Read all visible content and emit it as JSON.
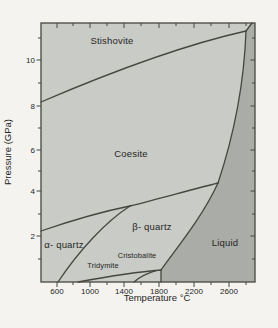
{
  "figure": {
    "description_labels": {
      "stishovite": "Stishovite",
      "coesite": "Coesite",
      "alpha_quartz": "α- quartz",
      "beta_quartz": "β- quartz",
      "cristobalite": "Cristobalite",
      "tridymite": "Tridymite",
      "liquid": "Liquid"
    }
  },
  "axes": {
    "x": {
      "title": "Temperature °C",
      "major": [
        {
          "t": "600",
          "px": 57
        },
        {
          "t": "1000",
          "px": 90
        },
        {
          "t": "1400",
          "px": 124
        },
        {
          "t": "1800",
          "px": 159
        },
        {
          "t": "2200",
          "px": 194
        },
        {
          "t": "2600",
          "px": 229
        }
      ],
      "minor_px": [
        73,
        107,
        141,
        176,
        211,
        246
      ]
    },
    "y": {
      "title": "Pressure (GPa)",
      "major": [
        {
          "t": "2",
          "py": 236
        },
        {
          "t": "4",
          "py": 191
        },
        {
          "t": "6",
          "py": 150
        },
        {
          "t": "8",
          "py": 106
        },
        {
          "t": "10",
          "py": 60
        }
      ],
      "minor_py": [
        259,
        214,
        171,
        128,
        83,
        38
      ]
    }
  },
  "colors": {
    "page_bg": "#f4f3ef",
    "field_light": "#c9cbc6",
    "liquid_dark": "#a9aca7",
    "line": "#45473f",
    "text": "#26261f"
  },
  "paths": {
    "liquid_region": "M161,282 L161,270 C175,250 202,218 218,183 C234,135 244,85 246,31 L252,23 L255,23 L255,282 Z",
    "boundaries": [
      {
        "name": "coesite-stishovite",
        "d": "M41,102 C90,81 170,48 246,31"
      },
      {
        "name": "stishovite-liquid",
        "d": "M246,31 L252,23"
      },
      {
        "name": "coesite-liquid",
        "d": "M218,183 C234,135 244,85 246,31"
      },
      {
        "name": "beta-quartz-coesite",
        "d": "M130,206 C155,200 190,190 218,183"
      },
      {
        "name": "alpha-quartz-coesite",
        "d": "M41,231 C70,221 105,211 130,206"
      },
      {
        "name": "alpha-beta-quartz",
        "d": "M58,282 C78,252 105,222 130,206"
      },
      {
        "name": "beta-quartz-liquid",
        "d": "M161,270 C175,250 202,218 218,183"
      },
      {
        "name": "cristobalite-liquid",
        "d": "M161,282 L161,270"
      },
      {
        "name": "quartz-tridymite",
        "d": "M78,282 C105,277 135,272 161,270"
      },
      {
        "name": "tridymite-cristobalite",
        "d": "M134,282 C141,276 148,273 156,270.7"
      }
    ]
  },
  "chart_data": {
    "type": "line",
    "subtype": "phase-diagram",
    "xlabel": "Temperature °C",
    "ylabel": "Pressure (GPa)",
    "xlim": [
      420,
      2890
    ],
    "ylim": [
      0,
      11.6
    ],
    "x_ticks": [
      600,
      1000,
      1400,
      1800,
      2200,
      2600
    ],
    "y_ticks": [
      2,
      4,
      6,
      8,
      10
    ],
    "grid": false,
    "regions": [
      "Stishovite",
      "Coesite",
      "α- quartz",
      "β- quartz",
      "Cristobalite",
      "Tridymite",
      "Liquid"
    ],
    "series": [
      {
        "name": "coesite–stishovite boundary",
        "x": [
          415,
          980,
          1480,
          2100,
          2790
        ],
        "y": [
          8.0,
          9.0,
          9.7,
          10.6,
          11.2
        ]
      },
      {
        "name": "stishovite–liquid boundary",
        "x": [
          2790,
          2860
        ],
        "y": [
          11.2,
          11.6
        ]
      },
      {
        "name": "coesite–liquid boundary",
        "x": [
          2460,
          2650,
          2740,
          2790
        ],
        "y": [
          4.4,
          6.6,
          8.8,
          11.2
        ]
      },
      {
        "name": "beta-quartz–coesite boundary",
        "x": [
          1440,
          1910,
          2460
        ],
        "y": [
          3.4,
          3.9,
          4.4
        ]
      },
      {
        "name": "alpha-quartz–coesite boundary",
        "x": [
          415,
          810,
          1440
        ],
        "y": [
          2.3,
          2.8,
          3.4
        ]
      },
      {
        "name": "alpha–beta quartz boundary",
        "x": [
          610,
          1000,
          1440
        ],
        "y": [
          0.0,
          2.0,
          3.4
        ]
      },
      {
        "name": "beta-quartz–liquid boundary",
        "x": [
          1800,
          2110,
          2460
        ],
        "y": [
          0.5,
          2.9,
          4.4
        ]
      },
      {
        "name": "cristobalite–liquid boundary",
        "x": [
          1800,
          1800
        ],
        "y": [
          0.0,
          0.5
        ]
      },
      {
        "name": "quartz–tridymite boundary",
        "x": [
          840,
          1300,
          1800
        ],
        "y": [
          0.0,
          0.3,
          0.5
        ]
      },
      {
        "name": "tridymite–cristobalite boundary",
        "x": [
          1480,
          1760
        ],
        "y": [
          0.0,
          0.5
        ]
      }
    ]
  }
}
